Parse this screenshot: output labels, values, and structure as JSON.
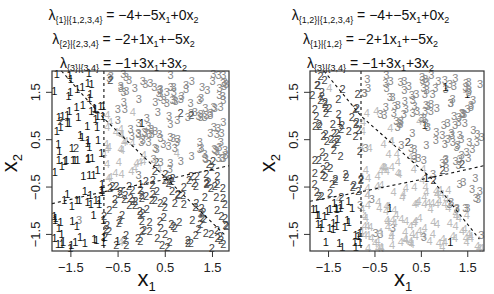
{
  "figure": {
    "panels": [
      {
        "id": "left",
        "titles": [
          {
            "lambda": "λ",
            "sub": "{1}|{1,2,3,4}",
            "rhs": " = −4+−5x",
            "s1": "1",
            "mid": "+0x",
            "s2": "2"
          },
          {
            "lambda": "λ",
            "sub": "{2}|{2,3,4}",
            "rhs": " = −2+1x",
            "s1": "1",
            "mid": "+−5x",
            "s2": "2"
          },
          {
            "lambda": "λ",
            "sub": "{3}|{3,4}",
            "rhs": " = −1+3x",
            "s1": "1",
            "mid": "+3x",
            "s2": "2"
          }
        ],
        "xlabel": "x",
        "xlabel_sub": "1",
        "ylabel": "x",
        "ylabel_sub": "2"
      },
      {
        "id": "right",
        "titles": [
          {
            "lambda": "λ",
            "sub": "{1,2}|{1,2,3,4}",
            "rhs": " = −4+−5x",
            "s1": "1",
            "mid": "+0x",
            "s2": "2"
          },
          {
            "lambda": "λ",
            "sub": "{1}|{1,2}",
            "rhs": " = −2+1x",
            "s1": "1",
            "mid": "+−5x",
            "s2": "2"
          },
          {
            "lambda": "λ",
            "sub": "{3}|{3,4}",
            "rhs": " = −1+3x",
            "s1": "1",
            "mid": "+3x",
            "s2": "2"
          }
        ],
        "xlabel": "x",
        "xlabel_sub": "1",
        "ylabel": "x",
        "ylabel_sub": "2"
      }
    ]
  },
  "chart_data": [
    {
      "type": "scatter",
      "title": "λ{1}|{1,2,3,4} = −4+−5x1+0x2; λ{2}|{2,3,4} = −2+1x1+−5x2; λ{3}|{3,4} = −1+3x1+3x2",
      "xlabel": "x1",
      "ylabel": "x2",
      "xlim": [
        -1.9,
        1.85
      ],
      "ylim": [
        -1.85,
        1.95
      ],
      "xticks": [
        -1.5,
        -0.5,
        0.5,
        1.5
      ],
      "yticks": [
        -1.5,
        -0.5,
        0.5,
        1.5
      ],
      "xtick_labels": [
        "−1.5",
        "−0.5",
        "0.5",
        "1.5"
      ],
      "ytick_labels": [
        "−1.5",
        "−0.5",
        "0.5",
        "1.5"
      ],
      "markers": "class labels 1,2,3,4 drawn as text",
      "class_colors": {
        "1": "#111111",
        "2": "#444444",
        "3": "#888888",
        "4": "#bbbbbb"
      },
      "grid": false,
      "boundaries": [
        {
          "style": "dashed",
          "points": [
            [
              -0.8,
              1.95
            ],
            [
              -0.8,
              -1.85
            ]
          ]
        },
        {
          "style": "dashed",
          "points": [
            [
              -1.7,
              1.95
            ],
            [
              -0.8,
              0.95
            ],
            [
              1.75,
              -1.5
            ]
          ]
        },
        {
          "style": "dashed",
          "points": [
            [
              -1.9,
              -0.85
            ],
            [
              -0.8,
              -0.6
            ],
            [
              0.7,
              -0.3
            ],
            [
              1.85,
              -0.05
            ]
          ]
        }
      ],
      "n_points": 400,
      "seed": 11
    },
    {
      "type": "scatter",
      "title": "λ{1,2}|{1,2,3,4} = −4+−5x1+0x2; λ{1}|{1,2} = −2+1x1+−5x2; λ{3}|{3,4} = −1+3x1+3x2",
      "xlabel": "x1",
      "ylabel": "x2",
      "xlim": [
        -1.9,
        1.85
      ],
      "ylim": [
        -1.85,
        1.95
      ],
      "xticks": [
        -1.5,
        -0.5,
        0.5,
        1.5
      ],
      "yticks": [
        -1.5,
        -0.5,
        0.5,
        1.5
      ],
      "xtick_labels": [
        "−1.5",
        "−0.5",
        "0.5",
        "1.5"
      ],
      "ytick_labels": [
        "−1.5",
        "−0.5",
        "0.5",
        "1.5"
      ],
      "markers": "class labels 1,2,3,4 drawn as text",
      "class_colors": {
        "1": "#111111",
        "2": "#444444",
        "3": "#888888",
        "4": "#bbbbbb"
      },
      "grid": false,
      "boundaries": [
        {
          "style": "dashed",
          "points": [
            [
              -0.8,
              1.95
            ],
            [
              -0.8,
              -1.85
            ]
          ]
        },
        {
          "style": "dashed",
          "points": [
            [
              -1.6,
              1.95
            ],
            [
              -0.8,
              1.0
            ],
            [
              0.7,
              -0.3
            ],
            [
              1.75,
              -1.6
            ]
          ]
        },
        {
          "style": "dashed",
          "points": [
            [
              -1.9,
              -0.8
            ],
            [
              -0.8,
              -0.6
            ],
            [
              0.7,
              -0.3
            ],
            [
              1.85,
              -0.05
            ]
          ]
        }
      ],
      "n_points": 400,
      "seed": 23
    }
  ]
}
